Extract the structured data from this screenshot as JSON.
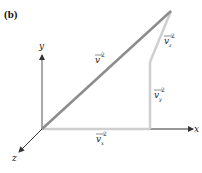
{
  "panel_label": "(b)",
  "axes": {
    "x_label": "x",
    "y_label": "y",
    "z_label": "z"
  },
  "vectors": {
    "resultant": {
      "base": "v",
      "sup": "2"
    },
    "vx": {
      "base": "v",
      "sub": "x",
      "sup": "2"
    },
    "vy": {
      "base": "v",
      "sub": "y",
      "sup": "2"
    },
    "vz": {
      "base": "v",
      "sub": "z",
      "sup": "2"
    }
  },
  "colors": {
    "resultant": "#8c8c8c",
    "components": "#cfcfcf",
    "axes": "#333333"
  }
}
